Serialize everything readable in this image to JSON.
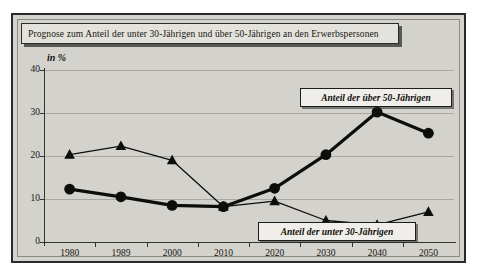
{
  "title": "Prognose zum Anteil der unter 30-Jährigen und über 50-Jährigen an den Erwerbspersonen",
  "unit_label": "in %",
  "legend": {
    "over50": "Anteil der über 50-Jährigen",
    "under30": "Anteil der unter 30-Jährigen"
  },
  "colors": {
    "background": "#d4d2cd",
    "frame": "#2a2a28",
    "series": "#0d0d0b",
    "gridline": "#a9a7a2",
    "axis": "#33332f",
    "plaque": "#e4e2dd"
  },
  "chart_data": {
    "type": "line",
    "title": "Prognose zum Anteil der unter 30-Jährigen und über 50-Jährigen an den Erwerbspersonen",
    "xlabel": "",
    "ylabel": "in %",
    "ylim": [
      0,
      40
    ],
    "yticks": [
      0,
      10,
      20,
      30,
      40
    ],
    "grid": true,
    "legend_position": "inline-annotation",
    "categories": [
      "1980",
      "1989",
      "2000",
      "2010",
      "2020",
      "2030",
      "2040",
      "2050"
    ],
    "series": [
      {
        "name": "Anteil der über 50-Jährigen",
        "marker": "circle",
        "values": [
          12.3,
          10.5,
          8.5,
          8.2,
          12.5,
          20.3,
          30.2,
          25.3
        ]
      },
      {
        "name": "Anteil der unter 30-Jährigen",
        "marker": "triangle",
        "values": [
          20.3,
          22.3,
          19.0,
          8.2,
          9.5,
          5.0,
          4.0,
          7.0
        ]
      }
    ]
  }
}
